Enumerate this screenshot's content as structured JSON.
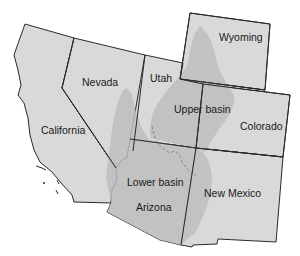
{
  "map": {
    "title": "Colorado River Basin states",
    "colors": {
      "state_fill": "#d9d9d9",
      "basin_fill": "#bdbdbd",
      "border": "#2a2a2a",
      "background": "#ffffff"
    },
    "states": [
      {
        "name": "California"
      },
      {
        "name": "Nevada"
      },
      {
        "name": "Utah"
      },
      {
        "name": "Wyoming"
      },
      {
        "name": "Colorado"
      },
      {
        "name": "Arizona"
      },
      {
        "name": "New Mexico"
      }
    ],
    "regions": [
      {
        "name": "Upper basin"
      },
      {
        "name": "Lower basin"
      }
    ]
  }
}
